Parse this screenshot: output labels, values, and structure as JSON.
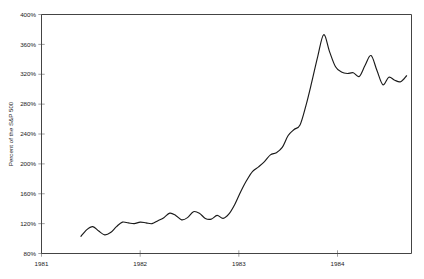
{
  "chart_data": {
    "type": "line",
    "title": "",
    "subtitle": "",
    "xlabel": "",
    "ylabel": "Percent of the S&P 500",
    "xlim": [
      1981.0,
      1984.75
    ],
    "ylim": [
      80,
      400
    ],
    "grid": false,
    "legend": null,
    "y_ticks": [
      80,
      120,
      160,
      200,
      240,
      280,
      320,
      360,
      400
    ],
    "y_tick_labels": [
      "80%",
      "120%",
      "160%",
      "200%",
      "240%",
      "280%",
      "320%",
      "360%",
      "400%"
    ],
    "x_ticks": [
      1981,
      1982,
      1983,
      1984
    ],
    "x_tick_labels": [
      "1981",
      "1982",
      "1983",
      "1984"
    ],
    "series": [
      {
        "name": "Percent of the S&P 500",
        "color": "#1a1a1a",
        "x": [
          1981.4,
          1981.46,
          1981.52,
          1981.58,
          1981.64,
          1981.7,
          1981.76,
          1981.82,
          1981.88,
          1981.94,
          1982.0,
          1982.06,
          1982.12,
          1982.18,
          1982.24,
          1982.3,
          1982.36,
          1982.42,
          1982.48,
          1982.54,
          1982.6,
          1982.66,
          1982.72,
          1982.78,
          1982.84,
          1982.9,
          1982.96,
          1983.02,
          1983.08,
          1983.14,
          1983.2,
          1983.26,
          1983.32,
          1983.38,
          1983.44,
          1983.5,
          1983.56,
          1983.62,
          1983.68,
          1983.74,
          1983.8,
          1983.86,
          1983.92,
          1983.98,
          1984.04,
          1984.1,
          1984.16,
          1984.22,
          1984.28,
          1984.34,
          1984.4,
          1984.46,
          1984.52,
          1984.58,
          1984.64,
          1984.7
        ],
        "y": [
          103,
          112,
          116,
          110,
          105,
          108,
          116,
          122,
          121,
          120,
          122,
          121,
          120,
          124,
          128,
          134,
          131,
          125,
          128,
          136,
          134,
          127,
          126,
          131,
          127,
          133,
          146,
          163,
          178,
          190,
          196,
          203,
          212,
          215,
          222,
          238,
          246,
          252,
          278,
          310,
          344,
          373,
          350,
          330,
          323,
          321,
          322,
          317,
          332,
          345,
          325,
          306,
          316,
          312,
          310,
          318
        ]
      }
    ]
  },
  "axis": {
    "y_title": "Percent of the S&P 500"
  }
}
